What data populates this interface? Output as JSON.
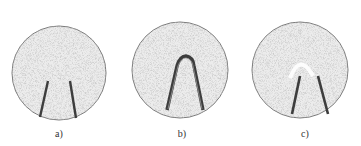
{
  "figure": {
    "panels": [
      {
        "id": "a",
        "label": "a)",
        "description": "two separate wire ends"
      },
      {
        "id": "b",
        "label": "b)",
        "description": "wire bent into a closed U-loop"
      },
      {
        "id": "c",
        "label": "c)",
        "description": "wire loop with faded (melted) apex"
      }
    ],
    "colors": {
      "background": "#ffffff",
      "disc_fill": "#e9e9e9",
      "disc_outline": "#7a7a7a",
      "wire": "#3d3d3d",
      "speckle": "#b5b5b5",
      "label": "#333333"
    }
  }
}
